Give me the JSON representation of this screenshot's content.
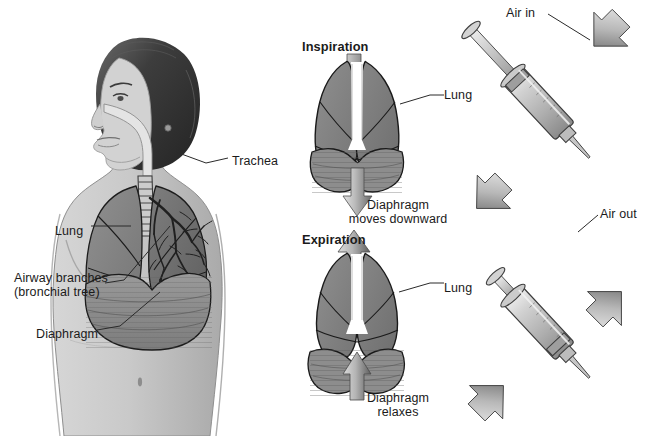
{
  "figure": {
    "background_color": "#ffffff",
    "width": 647,
    "height": 436
  },
  "colors": {
    "skin": "#c9c9c9",
    "skin_shadow": "#b0b0b0",
    "lung_fill": "#8a8a8a",
    "lung_fill_dark": "#6f6f6f",
    "lung_outline": "#1c1c1c",
    "diaphragm": "#8f8f8f",
    "bronchial_tree": "#262626",
    "hair_dark": "#3a3a3a",
    "arrow_light": "#d8d8d8",
    "arrow_dark": "#6b6b6b",
    "syringe_body": "#cfcfcf",
    "syringe_outline": "#3c3c3c",
    "text": "#1b1b1b",
    "leader_line": "#2a2a2a"
  },
  "anatomy_panel": {
    "name": "Human torso with respiratory system",
    "labels": [
      {
        "id": "trachea",
        "text": "Trachea",
        "x": 232,
        "y": 154,
        "align": "left"
      },
      {
        "id": "lung",
        "text": "Lung",
        "x": 55,
        "y": 224,
        "align": "left"
      },
      {
        "id": "airway-branches",
        "text": "Airway branches\n(bronchial tree)",
        "x": 14,
        "y": 278,
        "align": "left"
      },
      {
        "id": "diaphragm",
        "text": "Diaphragm",
        "x": 36,
        "y": 327,
        "align": "left"
      }
    ]
  },
  "inspiration_panel": {
    "heading": "Inspiration",
    "heading_x": 302,
    "heading_y": 40,
    "lung_label": "Lung",
    "lung_label_x": 444,
    "lung_label_y": 88,
    "caption": "Diaphragm\nmoves downward",
    "caption_x": 375,
    "caption_y": 200,
    "arrow_direction": "down",
    "arrow_count": 2
  },
  "expiration_panel": {
    "heading": "Expiration",
    "heading_x": 302,
    "heading_y": 233,
    "lung_label": "Lung",
    "lung_label_x": 444,
    "lung_label_y": 281,
    "caption": "Diaphragm\nrelaxes",
    "caption_x": 375,
    "caption_y": 393,
    "arrow_direction": "up",
    "arrow_count": 2
  },
  "syringe_panel": {
    "name": "Syringe analogy of breathing",
    "top": {
      "label": "Air in",
      "label_x": 506,
      "label_y": 6,
      "state": "plunger-pulled-out",
      "nozzle_arrow_direction": "in-down-left",
      "plunger_arrow_direction": "out-down-left"
    },
    "bottom": {
      "label": "Air out",
      "label_x": 600,
      "label_y": 207,
      "state": "plunger-pushed-in",
      "nozzle_arrow_direction": "out-up-right",
      "plunger_arrow_direction": "in-up-right"
    }
  }
}
